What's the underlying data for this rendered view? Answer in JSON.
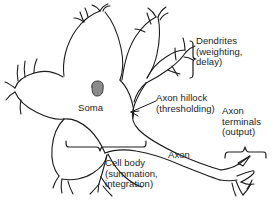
{
  "figure": {
    "type": "diagram",
    "background_color": "#ffffff",
    "ink_color": "#1c1c1c",
    "nucleus_fill": "#8a8a8a",
    "width": 276,
    "height": 214
  },
  "labels": {
    "dendrites": "Dendrites\n(weighting,\ndelay)",
    "soma": "Soma",
    "axon_hillock": "Axon hillock\n(thresholding)",
    "axon_terminals": "Axon\nterminals\n(output)",
    "axon": "Axon",
    "cell_body": "Cell body\n(summation,\nintegration)"
  },
  "parts": [
    {
      "id": "dendrites",
      "name": "Dendrites",
      "function": "weighting, delay"
    },
    {
      "id": "soma",
      "name": "Soma",
      "function": ""
    },
    {
      "id": "nucleus",
      "name": "Nucleus",
      "function": ""
    },
    {
      "id": "axon-hillock",
      "name": "Axon hillock",
      "function": "thresholding"
    },
    {
      "id": "axon",
      "name": "Axon",
      "function": ""
    },
    {
      "id": "axon-terminals",
      "name": "Axon terminals",
      "function": "output"
    },
    {
      "id": "cell-body",
      "name": "Cell body",
      "function": "summation, integration"
    }
  ],
  "annotations": {
    "brackets": [
      "dendrites-bracket",
      "cell-body-bracket",
      "axon-terminals-bracket"
    ],
    "arrows": [
      "axon-hillock-arrow"
    ]
  }
}
